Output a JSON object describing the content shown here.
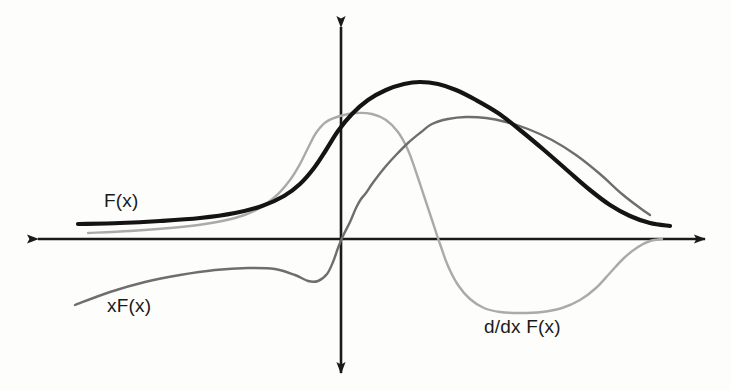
{
  "figure": {
    "title": "",
    "background_color": "#fdfdfc",
    "axes": {
      "name": "cartesian-axes",
      "x_axis": {
        "color": "#1a1a1a",
        "y_pixel": 239,
        "x_start": 38,
        "x_end": 705,
        "arrow_left": true,
        "arrow_right": true
      },
      "y_axis": {
        "color": "#1a1a1a",
        "x_pixel": 341,
        "y_start": 27,
        "y_end": 373,
        "arrow_up": true,
        "arrow_down": true
      }
    },
    "labels": [
      {
        "id": "F(x)",
        "text": "F(x)",
        "x": 104,
        "y": 190,
        "color": "#1a1a1a"
      },
      {
        "id": "xF(x)",
        "text": "xF(x)",
        "x": 107,
        "y": 295,
        "color": "#1a1a1a"
      },
      {
        "id": "d/dx F(x)",
        "text": "d/dx F(x)",
        "x": 484,
        "y": 316,
        "color": "#1a1a1a"
      }
    ]
  },
  "chart_data": {
    "type": "line",
    "title": "",
    "xlabel": "",
    "ylabel": "",
    "grid": false,
    "legend_position": "inline-annotations",
    "axis_style": "hand-drawn cartesian axes with arrowheads on all four ends",
    "x_axis_zero_pixel": 341,
    "y_axis_zero_pixel": 239,
    "xlim": [
      38,
      705
    ],
    "ylim": [
      373,
      27
    ],
    "series": [
      {
        "name": "F(x)",
        "label": "F(x)",
        "color": "#141414",
        "stroke_width": 4.2,
        "description": "Bell-shaped sigmoid-like positive hump, entirely above the x-axis; flat tail on the left, rises through the y-axis, peaks right of origin, decays back to a flat tail on the right.",
        "points": [
          [
            78,
            224
          ],
          [
            120,
            223
          ],
          [
            160,
            221
          ],
          [
            200,
            218
          ],
          [
            235,
            213
          ],
          [
            262,
            206
          ],
          [
            284,
            196
          ],
          [
            300,
            184
          ],
          [
            314,
            168
          ],
          [
            326,
            150
          ],
          [
            338,
            131
          ],
          [
            352,
            114
          ],
          [
            368,
            100
          ],
          [
            386,
            90
          ],
          [
            404,
            84
          ],
          [
            420,
            82
          ],
          [
            438,
            84
          ],
          [
            456,
            90
          ],
          [
            476,
            100
          ],
          [
            498,
            113
          ],
          [
            520,
            130
          ],
          [
            544,
            150
          ],
          [
            568,
            171
          ],
          [
            590,
            190
          ],
          [
            610,
            205
          ],
          [
            630,
            216
          ],
          [
            650,
            223
          ],
          [
            670,
            226
          ]
        ],
        "peak": {
          "x": 420,
          "y": 82
        }
      },
      {
        "name": "xF(x)",
        "label": "xF(x)",
        "color": "#6e6e6e",
        "stroke_width": 2.4,
        "description": "Starts low on the lower-left below the x-axis, rises to a shallow local maximum, dips slightly, then climbs steeply crossing the x-axis near the origin, rises to a broad flat maximum right of the black peak, then decays toward the right.",
        "points": [
          [
            75,
            305
          ],
          [
            110,
            292
          ],
          [
            145,
            282
          ],
          [
            180,
            275
          ],
          [
            215,
            270
          ],
          [
            248,
            268
          ],
          [
            275,
            269
          ],
          [
            295,
            275
          ],
          [
            308,
            281
          ],
          [
            318,
            281
          ],
          [
            327,
            274
          ],
          [
            333,
            262
          ],
          [
            338,
            248
          ],
          [
            343,
            236
          ],
          [
            350,
            222
          ],
          [
            356,
            208
          ],
          [
            361,
            199
          ],
          [
            366,
            193
          ],
          [
            372,
            184
          ],
          [
            378,
            176
          ],
          [
            386,
            166
          ],
          [
            396,
            155
          ],
          [
            408,
            143
          ],
          [
            420,
            133
          ],
          [
            432,
            124
          ],
          [
            448,
            119
          ],
          [
            466,
            117
          ],
          [
            486,
            118
          ],
          [
            506,
            122
          ],
          [
            528,
            129
          ],
          [
            552,
            140
          ],
          [
            576,
            155
          ],
          [
            600,
            174
          ],
          [
            622,
            194
          ],
          [
            640,
            208
          ],
          [
            650,
            215
          ]
        ],
        "local_max_left": {
          "x": 248,
          "y": 268
        },
        "peak": {
          "x": 470,
          "y": 117
        }
      },
      {
        "name": "d/dx F(x)",
        "label": "d/dx F(x)",
        "color": "#aaaaaa",
        "stroke_width": 2.4,
        "description": "Derivative of F(x): flat near zero on the left, rises to a positive maximum just left of where F(x) is steepest, crosses zero at F(x)'s peak, falls to a deep negative minimum, stays in a flat negative trough, then rises back toward zero on the right.",
        "points": [
          [
            88,
            233
          ],
          [
            130,
            231
          ],
          [
            170,
            228
          ],
          [
            205,
            224
          ],
          [
            235,
            218
          ],
          [
            258,
            209
          ],
          [
            276,
            196
          ],
          [
            290,
            180
          ],
          [
            300,
            164
          ],
          [
            308,
            148
          ],
          [
            316,
            133
          ],
          [
            326,
            122
          ],
          [
            340,
            116
          ],
          [
            356,
            113
          ],
          [
            372,
            114
          ],
          [
            386,
            120
          ],
          [
            398,
            132
          ],
          [
            408,
            150
          ],
          [
            416,
            172
          ],
          [
            424,
            196
          ],
          [
            432,
            220
          ],
          [
            440,
            244
          ],
          [
            448,
            266
          ],
          [
            458,
            285
          ],
          [
            470,
            299
          ],
          [
            484,
            308
          ],
          [
            500,
            312
          ],
          [
            520,
            313
          ],
          [
            542,
            312
          ],
          [
            562,
            308
          ],
          [
            580,
            300
          ],
          [
            596,
            288
          ],
          [
            610,
            273
          ],
          [
            624,
            258
          ],
          [
            638,
            247
          ],
          [
            650,
            241
          ],
          [
            662,
            239
          ]
        ],
        "peak": {
          "x": 358,
          "y": 113
        },
        "trough": {
          "x": 516,
          "y": 313
        },
        "zero_crossing": {
          "x": 425,
          "y": 239
        }
      }
    ]
  }
}
